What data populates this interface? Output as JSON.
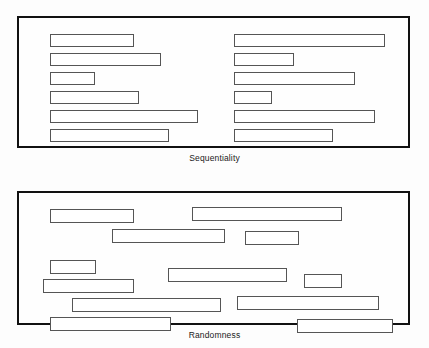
{
  "figure": {
    "background_color": "#fdfdfd",
    "border_color": "#111111",
    "bar_border_color": "#555555",
    "bar_fill_color": "#ffffff",
    "caption_color": "#1b1b1b"
  },
  "panels": [
    {
      "id": "sequentiality",
      "caption": "Sequentiality",
      "frame": {
        "x": 17,
        "y": 16,
        "width": 393,
        "height": 132
      },
      "caption_y": 153,
      "bars": [
        {
          "x": 48,
          "y": 32,
          "width": 84,
          "height": 13
        },
        {
          "x": 48,
          "y": 51,
          "width": 111,
          "height": 13
        },
        {
          "x": 48,
          "y": 70,
          "width": 45,
          "height": 13
        },
        {
          "x": 48,
          "y": 89,
          "width": 89,
          "height": 13
        },
        {
          "x": 48,
          "y": 108,
          "width": 148,
          "height": 13
        },
        {
          "x": 48,
          "y": 127,
          "width": 119,
          "height": 13
        },
        {
          "x": 232,
          "y": 32,
          "width": 151,
          "height": 13
        },
        {
          "x": 232,
          "y": 51,
          "width": 60,
          "height": 13
        },
        {
          "x": 232,
          "y": 70,
          "width": 121,
          "height": 13
        },
        {
          "x": 232,
          "y": 89,
          "width": 38,
          "height": 13
        },
        {
          "x": 232,
          "y": 108,
          "width": 141,
          "height": 13
        },
        {
          "x": 232,
          "y": 127,
          "width": 99,
          "height": 13
        }
      ]
    },
    {
      "id": "randomness",
      "caption": "Randomness",
      "frame": {
        "x": 17,
        "y": 191,
        "width": 393,
        "height": 134
      },
      "caption_y": 330,
      "bars": [
        {
          "x": 48,
          "y": 207,
          "width": 84,
          "height": 14
        },
        {
          "x": 190,
          "y": 205,
          "width": 150,
          "height": 14
        },
        {
          "x": 110,
          "y": 227,
          "width": 113,
          "height": 14
        },
        {
          "x": 243,
          "y": 229,
          "width": 54,
          "height": 14
        },
        {
          "x": 48,
          "y": 258,
          "width": 46,
          "height": 14
        },
        {
          "x": 166,
          "y": 266,
          "width": 119,
          "height": 14
        },
        {
          "x": 302,
          "y": 272,
          "width": 38,
          "height": 14
        },
        {
          "x": 41,
          "y": 277,
          "width": 91,
          "height": 14
        },
        {
          "x": 70,
          "y": 296,
          "width": 149,
          "height": 14
        },
        {
          "x": 235,
          "y": 294,
          "width": 142,
          "height": 14
        },
        {
          "x": 48,
          "y": 315,
          "width": 121,
          "height": 14
        },
        {
          "x": 295,
          "y": 317,
          "width": 96,
          "height": 14
        }
      ]
    }
  ]
}
